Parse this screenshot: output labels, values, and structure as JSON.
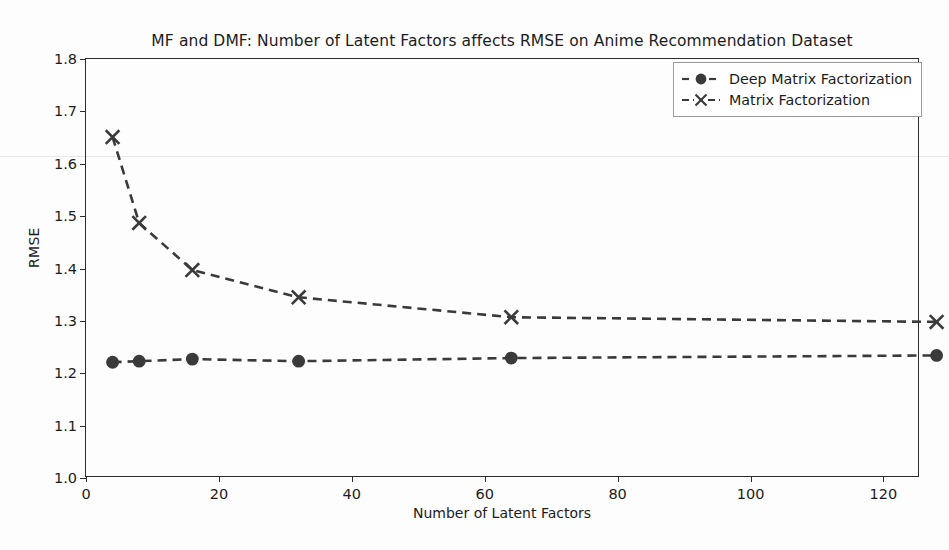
{
  "figure": {
    "title": "MF and DMF: Number of Latent Factors affects RMSE on Anime Recommendation Dataset",
    "background_color": "#fdfdfd",
    "line_color": "#3a3a3a"
  },
  "chart_data": {
    "type": "line",
    "title": "MF and DMF: Number of Latent Factors affects RMSE on Anime Recommendation Dataset",
    "xlabel": "Number of Latent Factors",
    "ylabel": "RMSE",
    "x": [
      4,
      8,
      16,
      32,
      64,
      128
    ],
    "xlim": [
      0,
      125.5
    ],
    "ylim": [
      1.0,
      1.8
    ],
    "xticks": [
      0,
      20,
      40,
      60,
      80,
      100,
      120
    ],
    "yticks": [
      1.0,
      1.1,
      1.2,
      1.3,
      1.4,
      1.5,
      1.6,
      1.7,
      1.8
    ],
    "xtick_labels": [
      "0",
      "20",
      "40",
      "60",
      "80",
      "100",
      "120"
    ],
    "ytick_labels": [
      "1.0",
      "1.1",
      "1.2",
      "1.3",
      "1.4",
      "1.5",
      "1.6",
      "1.7",
      "1.8"
    ],
    "grid": false,
    "legend_position": "upper right",
    "linestyle": "dashed",
    "series": [
      {
        "name": "Deep Matrix Factorization",
        "marker": "circle",
        "color": "#3a3a3a",
        "values": [
          1.221,
          1.223,
          1.227,
          1.223,
          1.229,
          1.234
        ]
      },
      {
        "name": "Matrix Factorization",
        "marker": "x",
        "color": "#3a3a3a",
        "values": [
          1.651,
          1.487,
          1.397,
          1.345,
          1.307,
          1.298
        ]
      }
    ]
  },
  "legend": {
    "items": [
      {
        "label": "Deep Matrix Factorization",
        "marker": "circle"
      },
      {
        "label": "Matrix Factorization",
        "marker": "x"
      }
    ]
  }
}
